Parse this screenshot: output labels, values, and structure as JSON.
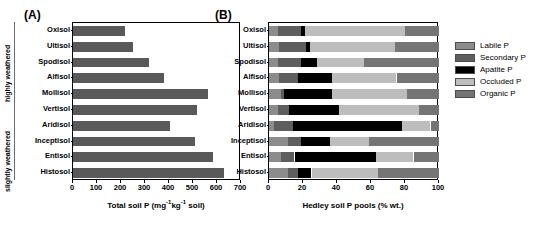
{
  "figure": {
    "panel_a_tag": "(A)",
    "panel_b_tag": "(B)",
    "weathering_top": "highly weathered",
    "weathering_bottom": "slightly weathered"
  },
  "colors": {
    "labile": "#8c8c8c",
    "secondary": "#5e5e5e",
    "apatite": "#000000",
    "occluded": "#bdbdbd",
    "organic": "#757575",
    "total_bar": "#595959",
    "axis": "#000000",
    "bracket": "#6e6e6e"
  },
  "chart_data": [
    {
      "type": "bar",
      "id": "panel-a",
      "title": "(A)",
      "orientation": "horizontal",
      "xlabel": "Total soil P (mg-1kg-1 soil)",
      "xlabel_parts": {
        "pre": "Total soil P (mg",
        "sup1": "-1",
        "mid": "kg",
        "sup2": "-1",
        "post": " soil)"
      },
      "ylabel": "",
      "xlim": [
        0,
        700
      ],
      "xticks": [
        0,
        100,
        200,
        300,
        400,
        500,
        600,
        700
      ],
      "xticklabels": [
        "0",
        "100",
        "200",
        "300",
        "400",
        "500",
        "600",
        "700"
      ],
      "grid": false,
      "categories": [
        "Oxisol",
        "Ultisol",
        "Spodisol",
        "Alfisol",
        "Mollisol",
        "Vertisol",
        "Aridisol",
        "Inceptisol",
        "Entisol",
        "Histosol"
      ],
      "values": [
        215,
        248,
        316,
        378,
        562,
        515,
        403,
        508,
        585,
        628
      ],
      "series": [
        {
          "name": "Total soil P",
          "values": [
            215,
            248,
            316,
            378,
            562,
            515,
            403,
            508,
            585,
            628
          ]
        }
      ]
    },
    {
      "type": "bar",
      "id": "panel-b",
      "title": "(B)",
      "orientation": "horizontal",
      "stacked": true,
      "xlabel": "Hedley soil P pools (% wt.)",
      "ylabel": "",
      "xlim": [
        0,
        100
      ],
      "xticks": [
        0,
        20,
        40,
        60,
        80,
        100
      ],
      "xticklabels": [
        "0",
        "20",
        "40",
        "60",
        "80",
        "100"
      ],
      "grid": false,
      "legend_position": "right",
      "categories": [
        "Oxisol",
        "Ultisol",
        "Spodisol",
        "Alfisol",
        "Mollisol",
        "Vertisol",
        "Aridisol",
        "Inceptisol",
        "Entisol",
        "Histosol"
      ],
      "series": [
        {
          "name": "Labile P",
          "values": [
            5,
            6,
            5,
            6,
            7,
            5,
            3,
            11,
            7,
            11
          ]
        },
        {
          "name": "Secondary P",
          "values": [
            14,
            16,
            14,
            11,
            2,
            7,
            11,
            8,
            8,
            6
          ]
        },
        {
          "name": "Apatite P",
          "values": [
            2,
            2,
            9,
            20,
            28,
            29,
            64,
            17,
            48,
            8
          ]
        },
        {
          "name": "Occluded P",
          "values": [
            59,
            50,
            28,
            38,
            44,
            47,
            17,
            23,
            22,
            39
          ]
        },
        {
          "name": "Organic P",
          "values": [
            20,
            26,
            44,
            25,
            19,
            12,
            5,
            41,
            15,
            36
          ]
        }
      ],
      "legend": [
        "Labile P",
        "Secondary P",
        "Apatite P",
        "Occluded P",
        "Organic P"
      ]
    }
  ]
}
